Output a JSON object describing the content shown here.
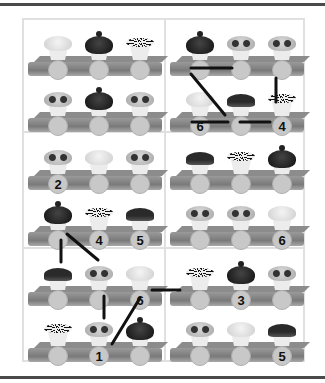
{
  "puzzle": {
    "type": "cupcake-shelf-connect",
    "colors": {
      "line": "#111111",
      "slot": "#c8c8c8",
      "shelf": "#8c8c8c",
      "divider": "#e0e0e0",
      "rule": "#4a4a4a"
    },
    "panels": [
      {
        "id": "p1",
        "shelves": [
          {
            "cups": [
              "plain",
              "dark",
              "sprinkle"
            ],
            "labels": [
              "",
              "",
              ""
            ]
          },
          {
            "cups": [
              "candy",
              "dark",
              "candy"
            ],
            "labels": [
              "",
              "",
              ""
            ]
          }
        ]
      },
      {
        "id": "p2",
        "shelves": [
          {
            "cups": [
              "dark",
              "candy",
              "candy"
            ],
            "labels": [
              "",
              "",
              ""
            ]
          },
          {
            "cups": [
              "plain",
              "drip",
              "sprinkle"
            ],
            "labels": [
              "6",
              "",
              "4"
            ]
          }
        ]
      },
      {
        "id": "p3",
        "shelves": [
          {
            "cups": [
              "candy",
              "plain",
              "candy"
            ],
            "labels": [
              "2",
              "",
              ""
            ]
          },
          {
            "cups": [
              "dark",
              "sprinkle",
              "drip"
            ],
            "labels": [
              "",
              "4",
              "5"
            ]
          }
        ]
      },
      {
        "id": "p4",
        "shelves": [
          {
            "cups": [
              "drip",
              "sprinkle",
              "dark"
            ],
            "labels": [
              "",
              "",
              ""
            ]
          },
          {
            "cups": [
              "candy",
              "candy",
              "plain"
            ],
            "labels": [
              "",
              "",
              "6"
            ]
          }
        ]
      },
      {
        "id": "p5",
        "shelves": [
          {
            "cups": [
              "drip",
              "candy",
              "plain"
            ],
            "labels": [
              "",
              "",
              "6"
            ]
          },
          {
            "cups": [
              "sprinkle",
              "candy",
              "dark"
            ],
            "labels": [
              "",
              "1",
              ""
            ]
          }
        ]
      },
      {
        "id": "p6",
        "shelves": [
          {
            "cups": [
              "sprinkle",
              "dark",
              "candy"
            ],
            "labels": [
              "",
              "3",
              ""
            ]
          },
          {
            "cups": [
              "candy",
              "plain",
              "drip"
            ],
            "labels": [
              "",
              "",
              "5"
            ]
          }
        ]
      }
    ]
  }
}
